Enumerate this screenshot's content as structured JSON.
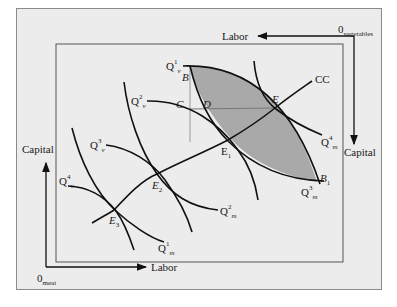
{
  "diagram": {
    "type": "edgeworth-box",
    "top_axis": {
      "origin_label": "0",
      "origin_subscript": "vegetables",
      "horizontal_label": "Labor",
      "vertical_label": "Capital"
    },
    "bottom_axis": {
      "origin_label": "0",
      "origin_subscript": "meat",
      "horizontal_label": "Labor",
      "vertical_label": "Capital"
    },
    "contract_curve_label": "CC",
    "points": {
      "B": "B",
      "B1_base": "B",
      "B1_sub": "1",
      "C": "C",
      "D": "D",
      "E": "E",
      "E1_base": "E",
      "E1_sub": "1",
      "E2_base": "E",
      "E2_sub": "2",
      "E3_base": "E",
      "E3_sub": "3"
    },
    "isoquants_vegetables": [
      {
        "base": "Q",
        "sub": "v",
        "sup": "1"
      },
      {
        "base": "Q",
        "sub": "v",
        "sup": "2"
      },
      {
        "base": "Q",
        "sub": "v",
        "sup": "3"
      },
      {
        "base": "Q",
        "sub": "v",
        "sup": "4"
      }
    ],
    "isoquants_meat": [
      {
        "base": "Q",
        "sub": "m",
        "sup": "1"
      },
      {
        "base": "Q",
        "sub": "m",
        "sup": "2"
      },
      {
        "base": "Q",
        "sub": "m",
        "sup": "3"
      },
      {
        "base": "Q",
        "sub": "m",
        "sup": "4"
      }
    ],
    "colors": {
      "background": "#ececec",
      "lens_fill": "#a9a9a9",
      "line": "#111111",
      "frame": "#8a8a8a"
    }
  }
}
